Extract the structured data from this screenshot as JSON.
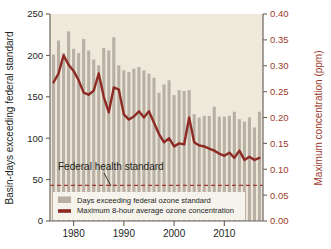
{
  "chart_data": {
    "type": "bar",
    "title": "",
    "subtitle": "",
    "xlabel": "",
    "ylabel": "Basin-days exceeding federal standard",
    "ylabel_right": "Maximum concentration (ppm)",
    "xlim": [
      1975.3,
      2017.7
    ],
    "ylim": [
      0,
      250
    ],
    "ylim_right": [
      0.0,
      0.4
    ],
    "grid": false,
    "legend_position": "bottom-left-inside",
    "x_ticks": [
      1980,
      1990,
      2000,
      2010
    ],
    "x_tick_labels": [
      "1980",
      "1990",
      "2000",
      "2010"
    ],
    "y_ticks_left": [
      0,
      50,
      100,
      150,
      200,
      250
    ],
    "y_tick_labels_left": [
      "0",
      "50",
      "100",
      "150",
      "200",
      "250"
    ],
    "y_ticks_right": [
      0.0,
      0.05,
      0.1,
      0.15,
      0.2,
      0.25,
      0.3,
      0.35,
      0.4
    ],
    "y_tick_labels_right": [
      "0.00",
      "0.05",
      "0.10",
      "0.15",
      "0.20",
      "0.25",
      "0.30",
      "0.35",
      "0.40"
    ],
    "x": [
      1976,
      1977,
      1978,
      1979,
      1980,
      1981,
      1982,
      1983,
      1984,
      1985,
      1986,
      1987,
      1988,
      1989,
      1990,
      1991,
      1992,
      1993,
      1994,
      1995,
      1996,
      1997,
      1998,
      1999,
      2000,
      2001,
      2002,
      2003,
      2004,
      2005,
      2006,
      2007,
      2008,
      2009,
      2010,
      2011,
      2012,
      2013,
      2014,
      2015,
      2016,
      2017
    ],
    "series": [
      {
        "name": "Days exceeding federal ozone standard",
        "type": "bar",
        "axis": "left",
        "units": "basin-days",
        "color": "#b8b0a4",
        "values": [
          201,
          218,
          203,
          229,
          208,
          203,
          220,
          206,
          195,
          188,
          209,
          206,
          222,
          188,
          182,
          180,
          184,
          186,
          182,
          178,
          173,
          155,
          165,
          170,
          152,
          158,
          157,
          158,
          129,
          125,
          127,
          127,
          138,
          126,
          126,
          127,
          132,
          123,
          120,
          125,
          113,
          132
        ]
      },
      {
        "name": "Maximum 8-hour average ozone concentration",
        "type": "line",
        "axis": "right",
        "units": "ppm",
        "color": "#8e2a24",
        "values": [
          0.268,
          0.285,
          0.32,
          0.302,
          0.29,
          0.272,
          0.248,
          0.244,
          0.252,
          0.285,
          0.24,
          0.21,
          0.258,
          0.254,
          0.206,
          0.196,
          0.202,
          0.212,
          0.2,
          0.212,
          0.19,
          0.168,
          0.152,
          0.16,
          0.144,
          0.15,
          0.148,
          0.2,
          0.152,
          0.146,
          0.144,
          0.14,
          0.136,
          0.13,
          0.126,
          0.132,
          0.122,
          0.136,
          0.118,
          0.124,
          0.118,
          0.122
        ]
      }
    ],
    "threshold_line": {
      "label": "Federal health standard",
      "value_left": 43,
      "value_right": 0.07,
      "color": "#a8352c",
      "style": "dashed"
    },
    "legend": [
      {
        "label": "Days exceeding federal ozone standard",
        "marker": "bar-swatch",
        "color": "#b8b0a4"
      },
      {
        "label": "Maximum 8-hour average ozone concentration",
        "marker": "line-swatch",
        "color": "#8e2a24"
      }
    ],
    "colors": {
      "plot_background": "#efe9dc",
      "bar": "#b8b0a4",
      "line": "#8e2a24",
      "axis": "#6b655e",
      "left_axis_text": "#231f1d",
      "right_axis_text": "#9c3b2e",
      "page_background": "#ffffff"
    }
  }
}
